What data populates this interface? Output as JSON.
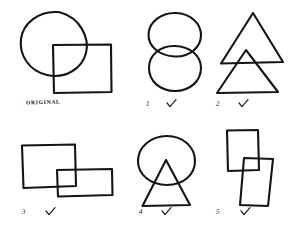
{
  "sheet": {
    "title": "hand-drawn-shape-copy-test",
    "background_color": "#ffffff",
    "ink_color": "#141414",
    "rows": 2,
    "columns": 3
  },
  "figures": [
    {
      "id": "original",
      "label": "ORIGINAL",
      "has_checkmark": false,
      "shapes": [
        "circle",
        "square"
      ],
      "description": "circle upper-left overlapping square lower-right"
    },
    {
      "id": "fig-1",
      "label": "1",
      "has_checkmark": true,
      "checkmark": "✓",
      "shapes": [
        "circle",
        "circle"
      ],
      "description": "two circles stacked vertically, overlapping"
    },
    {
      "id": "fig-2",
      "label": "2",
      "has_checkmark": true,
      "checkmark": "✓",
      "shapes": [
        "triangle",
        "triangle"
      ],
      "description": "large triangle above smaller triangle, overlapping"
    },
    {
      "id": "fig-3",
      "label": "3",
      "has_checkmark": true,
      "checkmark": "✓",
      "shapes": [
        "square",
        "rectangle"
      ],
      "description": "square upper-left overlapping wide rectangle lower-right"
    },
    {
      "id": "fig-4",
      "label": "4",
      "has_checkmark": true,
      "checkmark": "✓",
      "shapes": [
        "circle",
        "triangle"
      ],
      "description": "circle above triangle, overlapping"
    },
    {
      "id": "fig-5",
      "label": "5",
      "has_checkmark": true,
      "checkmark": "✓",
      "shapes": [
        "rectangle",
        "rectangle"
      ],
      "description": "two tall rectangles offset diagonally, overlapping"
    }
  ]
}
